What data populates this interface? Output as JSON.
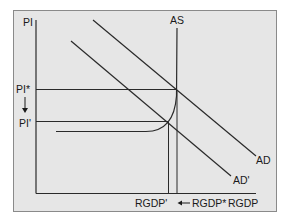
{
  "diagram": {
    "type": "AS-AD economics diagram",
    "frame_color": "#e6e6e6",
    "line_color": "#2a2a2a",
    "axes": {
      "y_label": "PI",
      "x_label": "RGDP"
    },
    "curves": {
      "as_label": "AS",
      "ad_label": "AD",
      "ad_prime_label": "AD'"
    },
    "y_ticks": {
      "pi_star": "PI*",
      "pi_prime": "PI'"
    },
    "x_ticks": {
      "rgdp_prime": "RGDP'",
      "rgdp_star": "RGDP*"
    },
    "arrows": {
      "price_shift": "down",
      "output_shift": "left"
    }
  }
}
